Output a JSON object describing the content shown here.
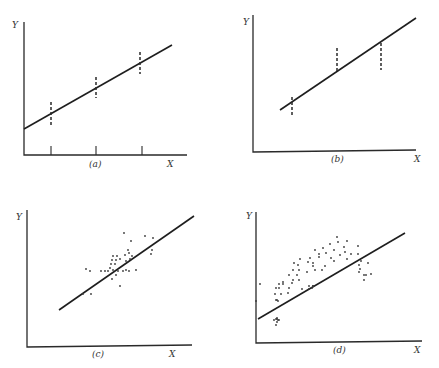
{
  "panels": [
    {
      "id": "a",
      "caption": "(a)",
      "y_label": "Y",
      "x_label": "X",
      "description": "Regression line with vertical dashed error bars at three X values, centered on the line"
    },
    {
      "id": "b",
      "caption": "(b)",
      "y_label": "Y",
      "x_label": "X",
      "description": "Regression line with dashed spread bars at three X values, not centered on the line"
    },
    {
      "id": "c",
      "caption": "(c)",
      "y_label": "Y",
      "x_label": "X",
      "description": "Scatter of points around regression line"
    },
    {
      "id": "d",
      "caption": "(d)",
      "y_label": "Y",
      "x_label": "X",
      "description": "Curved scatter pattern poorly fit by straight regression line"
    }
  ],
  "colors": {
    "ink": "#2a2a2a",
    "background": "#ffffff"
  }
}
